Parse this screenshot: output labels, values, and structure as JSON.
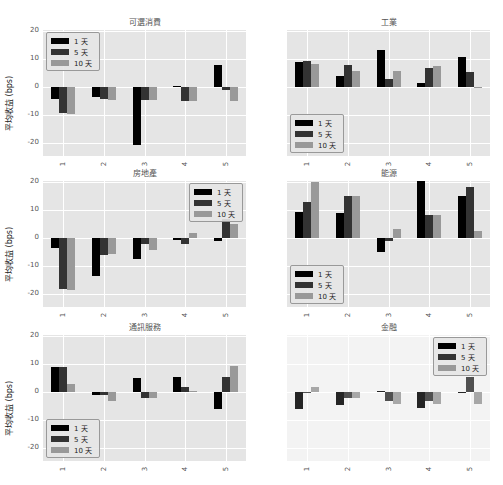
{
  "chart_data": [
    {
      "type": "bar",
      "title": "可選消費",
      "categories": [
        "1",
        "2",
        "3",
        "4",
        "5"
      ],
      "ylabel": "平均收益 (bps)",
      "ylim": [
        -24.5,
        20.5
      ],
      "yticks": [
        20,
        10,
        0,
        -10,
        -20
      ],
      "series": [
        {
          "name": "1 天",
          "values": [
            -4,
            -3.5,
            -20.5,
            0.5,
            8
          ]
        },
        {
          "name": "5 天",
          "values": [
            -9,
            -4,
            -4.5,
            -5,
            -1
          ]
        },
        {
          "name": "10 天",
          "values": [
            -9.5,
            -4.5,
            -4.5,
            -5,
            -5
          ]
        }
      ],
      "legend": "upper left"
    },
    {
      "type": "bar",
      "title": "工業",
      "categories": [
        "1",
        "2",
        "3",
        "4",
        "5"
      ],
      "ylabel": "",
      "ylim": [
        -24.5,
        20.5
      ],
      "yticks": [],
      "series": [
        {
          "name": "1 天",
          "values": [
            9,
            4,
            13.5,
            1.5,
            11
          ]
        },
        {
          "name": "5 天",
          "values": [
            9.5,
            8,
            3,
            7,
            5.5
          ]
        },
        {
          "name": "10 天",
          "values": [
            8.5,
            6,
            6,
            7.5,
            -0.3
          ]
        }
      ],
      "legend": "lower left"
    },
    {
      "type": "bar",
      "title": "房地產",
      "categories": [
        "1",
        "2",
        "3",
        "4",
        "5"
      ],
      "ylabel": "平均收益 (bps)",
      "ylim": [
        -24.5,
        20.5
      ],
      "yticks": [
        20,
        10,
        0,
        -10,
        -20
      ],
      "series": [
        {
          "name": "1 天",
          "values": [
            -3.5,
            -13.5,
            -7.5,
            -0.5,
            -1
          ]
        },
        {
          "name": "5 天",
          "values": [
            -18,
            -6,
            -2,
            -2,
            7
          ]
        },
        {
          "name": "10 天",
          "values": [
            -18.5,
            -5.5,
            -4,
            2,
            5
          ]
        }
      ],
      "legend": "upper right"
    },
    {
      "type": "bar",
      "title": "能源",
      "categories": [
        "1",
        "2",
        "3",
        "4",
        "5"
      ],
      "ylabel": "",
      "ylim": [
        -24.5,
        20.5
      ],
      "yticks": [],
      "series": [
        {
          "name": "1 天",
          "values": [
            9.5,
            9,
            -5,
            21,
            15
          ]
        },
        {
          "name": "5 天",
          "values": [
            13,
            15,
            -1,
            8.5,
            18.5
          ]
        },
        {
          "name": "10 天",
          "values": [
            20,
            15,
            3.5,
            8.5,
            2.5
          ]
        }
      ],
      "legend": "lower left"
    },
    {
      "type": "bar",
      "title": "通訊服務",
      "categories": [
        "1",
        "2",
        "3",
        "4",
        "5"
      ],
      "ylabel": "平均收益 (bps)",
      "ylim": [
        -24.5,
        20.5
      ],
      "yticks": [
        20,
        10,
        0,
        -10,
        -20
      ],
      "series": [
        {
          "name": "1 天",
          "values": [
            9,
            -1,
            5,
            5.5,
            -6
          ]
        },
        {
          "name": "5 天",
          "values": [
            9,
            -1,
            -2,
            2,
            5.5
          ]
        },
        {
          "name": "10 天",
          "values": [
            3,
            -3,
            -2,
            0.5,
            9.5
          ]
        }
      ],
      "legend": "lower left"
    },
    {
      "type": "bar",
      "title": "金融",
      "categories": [
        "1",
        "2",
        "3",
        "4",
        "5"
      ],
      "ylabel": "",
      "ylim": [
        -24.5,
        20.5
      ],
      "yticks": [],
      "series": [
        {
          "name": "1 天",
          "values": [
            -6,
            -4.5,
            0.5,
            -5.5,
            0
          ]
        },
        {
          "name": "5 天",
          "values": [
            0,
            -2,
            -3,
            -3,
            5.5
          ]
        },
        {
          "name": "10 天",
          "values": [
            2,
            -2,
            -4,
            -4,
            -4
          ]
        }
      ],
      "legend": "upper right"
    }
  ],
  "colors": {
    "d1": "#000000",
    "d5": "#333333",
    "d10": "#999999",
    "plot_bg": "#e5e5e5",
    "grid": "#ffffff"
  },
  "legend_labels": [
    "1 天",
    "5 天",
    "10 天"
  ]
}
